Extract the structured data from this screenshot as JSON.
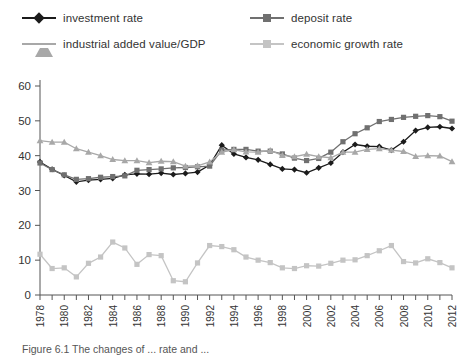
{
  "legend": {
    "items": [
      {
        "label": "investment rate",
        "marker": "diamond",
        "color": "#1b1b1b",
        "key": "investment_rate"
      },
      {
        "label": "deposit rate",
        "marker": "square",
        "color": "#707070",
        "key": "deposit_rate"
      },
      {
        "label": "industrial added value/GDP",
        "marker": "triangle",
        "color": "#a8a8a8",
        "key": "industrial_added_value_gdp"
      },
      {
        "label": "economic growth rate",
        "marker": "square",
        "color": "#c4c4c4",
        "key": "economic_growth_rate"
      }
    ]
  },
  "caption": {
    "text": "Figure 6.1 The changes of ... rate and ..."
  },
  "chart_data": {
    "type": "line",
    "title": "",
    "xlabel": "",
    "ylabel": "",
    "ylim": [
      0,
      60
    ],
    "ytick_step": 10,
    "yticks": [
      0,
      10,
      20,
      30,
      40,
      50,
      60
    ],
    "xlim": [
      1978,
      2012
    ],
    "grid": false,
    "legend_position": "top",
    "x": [
      1978,
      1979,
      1980,
      1981,
      1982,
      1983,
      1984,
      1985,
      1986,
      1987,
      1988,
      1989,
      1990,
      1991,
      1992,
      1993,
      1994,
      1995,
      1996,
      1997,
      1998,
      1999,
      2000,
      2001,
      2002,
      2003,
      2004,
      2005,
      2006,
      2007,
      2008,
      2009,
      2010,
      2011,
      2012
    ],
    "xtick_labels": [
      "1978",
      "",
      "1980",
      "",
      "1982",
      "",
      "1984",
      "",
      "1986",
      "",
      "1988",
      "",
      "1990",
      "",
      "1992",
      "",
      "1994",
      "",
      "1996",
      "",
      "1998",
      "",
      "2000",
      "",
      "2002",
      "",
      "2004",
      "",
      "2006",
      "",
      "2008",
      "",
      "2010",
      "",
      "2012"
    ],
    "series": [
      {
        "name": "investment rate",
        "marker": "diamond",
        "color": "#1b1b1b",
        "values": [
          38.2,
          36.1,
          34.3,
          32.5,
          33.0,
          33.2,
          33.5,
          34.5,
          34.8,
          34.7,
          35.0,
          34.6,
          34.9,
          35.3,
          37.3,
          43.0,
          40.5,
          39.5,
          38.8,
          37.5,
          36.2,
          36.0,
          35.1,
          36.5,
          37.9,
          41.0,
          43.2,
          42.7,
          42.6,
          41.6,
          44.0,
          47.2,
          48.1,
          48.3,
          47.8
        ]
      },
      {
        "name": "deposit rate",
        "marker": "square",
        "color": "#707070",
        "values": [
          37.9,
          36.0,
          34.5,
          33.2,
          33.4,
          33.8,
          34.0,
          34.2,
          35.8,
          36.0,
          36.2,
          36.5,
          36.6,
          36.8,
          37.0,
          41.6,
          41.8,
          41.8,
          41.3,
          41.3,
          40.5,
          39.3,
          38.6,
          39.2,
          41.0,
          44.0,
          46.3,
          48.0,
          49.8,
          50.4,
          51.0,
          51.3,
          51.5,
          51.2,
          49.9
        ]
      },
      {
        "name": "industrial added value/GDP",
        "marker": "triangle",
        "color": "#a8a8a8",
        "values": [
          44.3,
          43.9,
          43.9,
          42.0,
          41.0,
          40.0,
          38.9,
          38.6,
          38.6,
          38.0,
          38.4,
          38.3,
          37.0,
          37.1,
          38.2,
          41.0,
          41.7,
          41.1,
          41.0,
          41.5,
          40.1,
          39.7,
          40.4,
          39.7,
          39.4,
          41.0,
          41.0,
          41.8,
          42.0,
          41.6,
          41.2,
          39.8,
          40.0,
          39.9,
          38.3
        ]
      },
      {
        "name": "economic growth rate",
        "marker": "square",
        "color": "#c4c4c4",
        "values": [
          11.7,
          7.6,
          7.8,
          5.2,
          9.1,
          10.9,
          15.2,
          13.5,
          8.8,
          11.6,
          11.3,
          4.1,
          3.8,
          9.2,
          14.2,
          13.9,
          13.0,
          10.9,
          10.0,
          9.3,
          7.8,
          7.6,
          8.4,
          8.3,
          9.1,
          10.0,
          10.1,
          11.3,
          12.7,
          14.2,
          9.6,
          9.2,
          10.4,
          9.3,
          7.8
        ]
      }
    ]
  }
}
